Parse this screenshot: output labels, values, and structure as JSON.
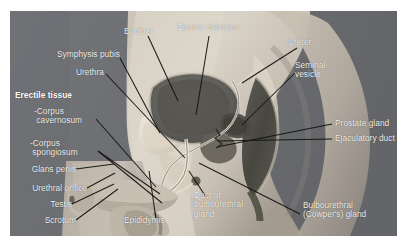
{
  "figure": {
    "caption": "",
    "background_color": "#ffffff",
    "plate_background_color": "#6f7174",
    "label_color": "#f2f2f0",
    "leader_line_color": "#141414"
  },
  "labels": [
    {
      "id": "bladder",
      "text": "Bladder",
      "bold": false
    },
    {
      "id": "ductus-deferens",
      "text": "Ductus deferens",
      "bold": false
    },
    {
      "id": "ureter",
      "text": "Ureter",
      "bold": false
    },
    {
      "id": "seminal-vesicle",
      "text": "Seminal\nvesicle",
      "bold": false
    },
    {
      "id": "symphysis-pubis",
      "text": "Symphysis pubis",
      "bold": false
    },
    {
      "id": "urethra",
      "text": "Urethra",
      "bold": false
    },
    {
      "id": "erectile-tissue",
      "text": "Erectile tissue",
      "bold": true
    },
    {
      "id": "corpus-cavernosum",
      "text": "-Corpus\n cavernosum",
      "bold": false
    },
    {
      "id": "corpus-spongiosum",
      "text": "-Corpus\n spongiosum",
      "bold": false
    },
    {
      "id": "glans-penis",
      "text": "Glans penis",
      "bold": false
    },
    {
      "id": "urethral-orifice",
      "text": "Urethral orifice",
      "bold": false
    },
    {
      "id": "testis",
      "text": "Testis",
      "bold": false
    },
    {
      "id": "scrotum",
      "text": "Scrotum",
      "bold": false
    },
    {
      "id": "epididymis",
      "text": "Epididymis",
      "bold": false
    },
    {
      "id": "prostate-gland",
      "text": "Prostate gland",
      "bold": false
    },
    {
      "id": "ejaculatory-duct",
      "text": "Ejaculatory duct",
      "bold": false
    },
    {
      "id": "duct-of-bulbourethral-gland",
      "text": "Duct of\nbulbourethral\ngland",
      "bold": false
    },
    {
      "id": "bulbourethral-gland",
      "text": "Bulbourethral\n(Cowper's) gland",
      "bold": false
    }
  ]
}
